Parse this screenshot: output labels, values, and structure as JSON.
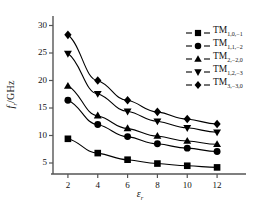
{
  "chart_data": {
    "type": "line",
    "title": "",
    "xlabel": "εr",
    "xlabel_base": "ε",
    "xlabel_sub": "r",
    "ylabel_base": "f",
    "ylabel_sub": "r",
    "ylabel_unit": "/GHz",
    "x": [
      2,
      4,
      6,
      8,
      10,
      12
    ],
    "xlim": [
      1,
      13
    ],
    "ylim": [
      3,
      31
    ],
    "xticks": [
      2,
      4,
      6,
      8,
      10,
      12
    ],
    "yticks": [
      5,
      10,
      15,
      20,
      25,
      30
    ],
    "xtick_labels": [
      "2",
      "4",
      "6",
      "8",
      "10",
      "12"
    ],
    "ytick_labels": [
      "5",
      "10",
      "15",
      "20",
      "25",
      "30"
    ],
    "grid": false,
    "legend_position": "top-right",
    "series": [
      {
        "name": "TM1,0,-1",
        "name_base": "TM",
        "name_sub": "1,0,−1",
        "marker": "square",
        "color": "#000000",
        "values": [
          9.4,
          6.8,
          5.6,
          4.9,
          4.5,
          4.2
        ]
      },
      {
        "name": "TM1,1,-2",
        "name_base": "TM",
        "name_sub": "1,1,−2",
        "marker": "circle",
        "color": "#000000",
        "values": [
          16.4,
          12.0,
          9.8,
          8.5,
          7.7,
          7.1
        ]
      },
      {
        "name": "TM2,-2,0",
        "name_base": "TM",
        "name_sub": "2,−2,0",
        "marker": "triangle-up",
        "color": "#000000",
        "values": [
          19.0,
          13.6,
          11.3,
          9.9,
          9.0,
          8.4
        ]
      },
      {
        "name": "TM1,2,-3",
        "name_base": "TM",
        "name_sub": "1,2,−3",
        "marker": "triangle-down",
        "color": "#000000",
        "values": [
          24.9,
          17.6,
          14.4,
          12.6,
          11.4,
          10.6
        ]
      },
      {
        "name": "TM3,-3,0",
        "name_base": "TM",
        "name_sub": "3,−3,0",
        "marker": "diamond",
        "color": "#000000",
        "values": [
          28.3,
          20.0,
          16.4,
          14.3,
          13.0,
          12.1
        ]
      }
    ]
  }
}
